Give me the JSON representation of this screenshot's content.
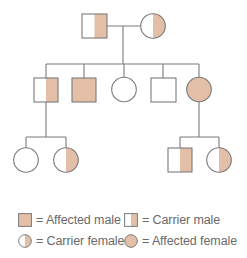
{
  "colors": {
    "affected_fill": "#e2bfa6",
    "unaffected_fill": "#ffffff",
    "stroke": "#7a7a7a",
    "legend_text": "#6a6a6a"
  },
  "pedigree": {
    "generations": [
      {
        "generation": 1,
        "individuals": [
          {
            "id": "I-1",
            "sex": "male",
            "status": "carrier"
          },
          {
            "id": "I-2",
            "sex": "female",
            "status": "carrier"
          }
        ]
      },
      {
        "generation": 2,
        "individuals": [
          {
            "id": "II-1",
            "sex": "male",
            "status": "carrier"
          },
          {
            "id": "II-2",
            "sex": "male",
            "status": "affected"
          },
          {
            "id": "II-3",
            "sex": "female",
            "status": "unaffected"
          },
          {
            "id": "II-4",
            "sex": "male",
            "status": "unaffected"
          },
          {
            "id": "II-5",
            "sex": "female",
            "status": "affected"
          }
        ]
      },
      {
        "generation": 3,
        "individuals": [
          {
            "id": "III-1",
            "sex": "female",
            "status": "unaffected",
            "parent": "II-1"
          },
          {
            "id": "III-2",
            "sex": "female",
            "status": "carrier",
            "parent": "II-1"
          },
          {
            "id": "III-3",
            "sex": "male",
            "status": "carrier",
            "parent": "II-5"
          },
          {
            "id": "III-4",
            "sex": "female",
            "status": "carrier",
            "parent": "II-5"
          }
        ]
      }
    ]
  },
  "legend": {
    "items": [
      {
        "symbol": "affected-male",
        "label": "= Affected male"
      },
      {
        "symbol": "carrier-male",
        "label": "= Carrier male"
      },
      {
        "symbol": "carrier-female",
        "label": "= Carrier female"
      },
      {
        "symbol": "affected-female",
        "label": "= Affected female"
      }
    ]
  }
}
